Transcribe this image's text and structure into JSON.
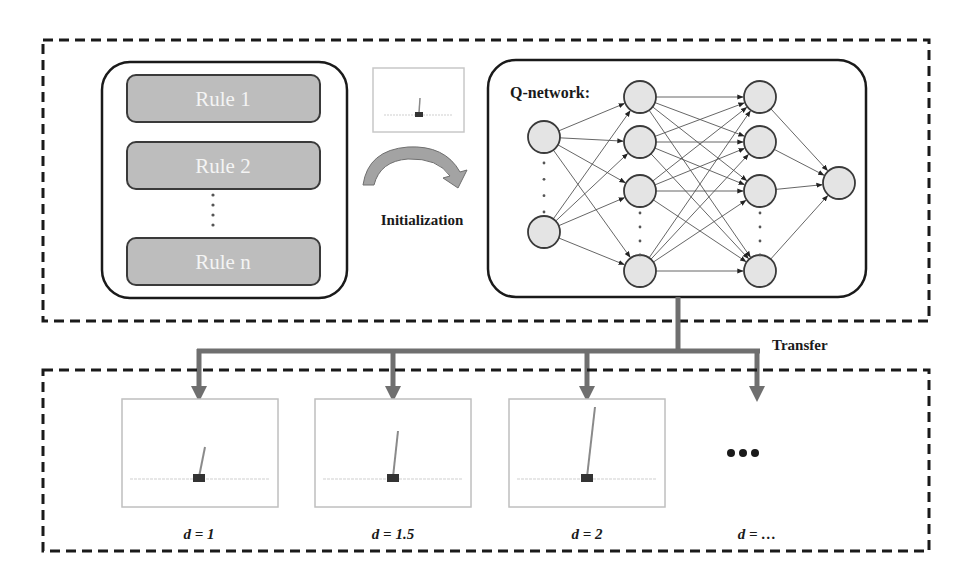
{
  "colors": {
    "frame": "#1a1a1a",
    "rule_fill": "#bdbdbd",
    "rule_stroke": "#3a3a3a",
    "rule_text": "#f4f4f4",
    "node_fill": "#e4e4e4",
    "node_stroke": "#3a3a3a",
    "edge": "#555555",
    "arrow": "#6f6f6f",
    "panel_border": "#bfbfbf",
    "cart": "#333333",
    "pole": "#8a8a8a",
    "track": "#cfcfcf",
    "init_arrow": "#9a9a9a"
  },
  "rules_panel": {
    "rules": [
      {
        "label": "Rule 1"
      },
      {
        "label": "Rule 2"
      },
      {
        "label": "Rule n"
      }
    ],
    "ellipsis": "vertical-dots"
  },
  "initialization": {
    "label": "Initialization",
    "preview_env": {
      "pole_angle_deg": 2,
      "pole_length": 26
    }
  },
  "q_network": {
    "title": "Q-network:",
    "layers": [
      {
        "name": "input",
        "x": 544,
        "nodes_y": [
          137,
          232
        ],
        "dots_y": [
          163,
          212
        ]
      },
      {
        "name": "hidden-1",
        "x": 640,
        "nodes_y": [
          97,
          142,
          191,
          271
        ],
        "dots_y": [
          213,
          255
        ]
      },
      {
        "name": "hidden-2",
        "x": 760,
        "nodes_y": [
          97,
          142,
          191,
          271
        ],
        "dots_y": [
          213,
          255
        ]
      },
      {
        "name": "output",
        "x": 839,
        "nodes_y": [
          183
        ],
        "dots_y": []
      }
    ],
    "node_radius": 16
  },
  "transfer": {
    "label": "Transfer"
  },
  "environments": [
    {
      "label": "d = 1",
      "pole_length": "short",
      "has_panel": true
    },
    {
      "label": "d = 1.5",
      "pole_length": "medium",
      "has_panel": true
    },
    {
      "label": "d = 2",
      "pole_length": "long",
      "has_panel": true
    },
    {
      "label": "d = …",
      "pole_length": null,
      "has_panel": false,
      "placeholder": "•••"
    }
  ]
}
